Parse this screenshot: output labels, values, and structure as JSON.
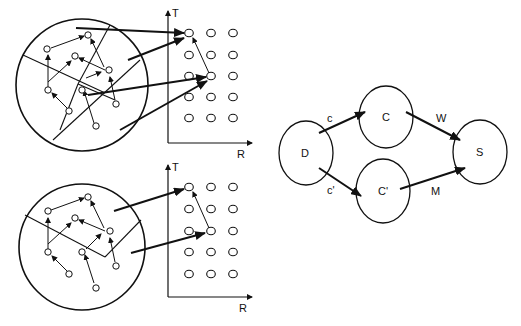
{
  "figure": {
    "panels": [
      {
        "id": "top-panel",
        "axis_labels": {
          "y": "T",
          "x": "R"
        },
        "grid": {
          "rows": 5,
          "cols": 3
        }
      },
      {
        "id": "bottom-panel",
        "axis_labels": {
          "y": "T",
          "x": "R"
        },
        "grid": {
          "rows": 5,
          "cols": 3
        }
      }
    ],
    "graph": {
      "nodes": [
        {
          "id": "D",
          "label": "D"
        },
        {
          "id": "C",
          "label": "C"
        },
        {
          "id": "C'",
          "label": "C'"
        },
        {
          "id": "S",
          "label": "S"
        }
      ],
      "edges": [
        {
          "from": "D",
          "to": "C",
          "label": "c"
        },
        {
          "from": "D",
          "to": "C'",
          "label": "c'"
        },
        {
          "from": "C",
          "to": "S",
          "label": "W"
        },
        {
          "from": "C'",
          "to": "S",
          "label": "M"
        }
      ]
    },
    "colors": {
      "ink": "#111111",
      "background": "#ffffff"
    }
  }
}
